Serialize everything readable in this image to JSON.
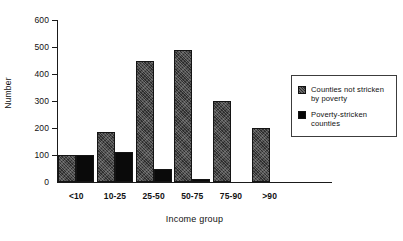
{
  "chart_data": {
    "type": "bar",
    "title": "",
    "xlabel": "Income group",
    "ylabel": "Number",
    "categories": [
      "<10",
      "10-25",
      "25-50",
      "50-75",
      "75-90",
      ">90"
    ],
    "series": [
      {
        "name": "Counties not stricken by poverty",
        "color": "#2e2e2e",
        "values": [
          100,
          185,
          450,
          490,
          300,
          200
        ]
      },
      {
        "name": "Poverty-stricken counties",
        "color": "#0a0a0a",
        "values": [
          100,
          113,
          50,
          10,
          0,
          0
        ]
      }
    ],
    "ylim": [
      0,
      600
    ],
    "yticks": [
      0,
      100,
      200,
      300,
      400,
      500,
      600
    ],
    "ytick_labels": [
      "0",
      "100",
      "200",
      "300",
      "400",
      "500",
      "600"
    ],
    "grid": false,
    "legend_position": "right"
  },
  "legend": {
    "entries": [
      {
        "label": "Counties not stricken\nby poverty",
        "swatch": "gray-hatched-swatch"
      },
      {
        "label": "Poverty-stricken\ncounties",
        "swatch": "black-swatch"
      }
    ]
  }
}
